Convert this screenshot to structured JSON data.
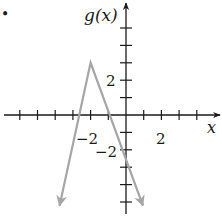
{
  "bullet": "•",
  "chart_data": {
    "type": "line",
    "title": "",
    "xlabel": "x",
    "ylabel": "g(x)",
    "xlim": [
      -6,
      5
    ],
    "ylim": [
      -5,
      5
    ],
    "x_tick_step": 1,
    "y_tick_step": 1,
    "x_tick_labels": [
      {
        "value": -2,
        "label": "−2"
      },
      {
        "value": 2,
        "label": "2"
      }
    ],
    "y_tick_labels": [
      {
        "value": 2,
        "label": "2"
      },
      {
        "value": -2,
        "label": "−2"
      }
    ],
    "grid": false,
    "function": "g(x) = -3|x + 2| + 3",
    "series": [
      {
        "name": "g(x)",
        "color": "#a6a6a6",
        "points": [
          {
            "x": -3.75,
            "y": -5.2
          },
          {
            "x": -2,
            "y": 3
          },
          {
            "x": 0.95,
            "y": -5.2
          }
        ],
        "arrows_at_ends": true
      }
    ],
    "axis_color": "#1a1a1a"
  },
  "labels": {
    "y_axis": "g(x)",
    "x_axis": "x",
    "x_tick_neg2": "−2",
    "x_tick_2": "2",
    "y_tick_2": "2",
    "y_tick_neg2": "−2"
  }
}
